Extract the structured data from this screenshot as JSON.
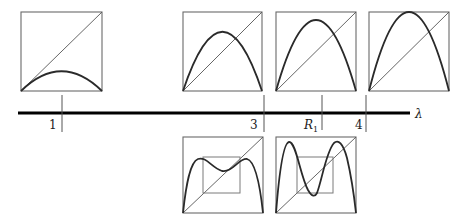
{
  "figure": {
    "axis": {
      "symbol": "λ",
      "ticks": [
        {
          "label": "1",
          "x": 62
        },
        {
          "label": "3",
          "x": 264
        },
        {
          "label": "R",
          "subscript": "1",
          "x": 322
        },
        {
          "label": "4",
          "x": 366
        }
      ]
    },
    "top_panels": [
      {
        "name": "lambda-1",
        "lambda": 1.0,
        "peak_fraction": 0.25
      },
      {
        "name": "lambda-3",
        "lambda": 3.0,
        "peak_fraction": 0.75
      },
      {
        "name": "lambda-R1",
        "lambda": 3.57,
        "peak_fraction": 0.9
      },
      {
        "name": "lambda-4",
        "lambda": 4.0,
        "peak_fraction": 1.0
      }
    ],
    "bottom_panels": [
      {
        "name": "second-iterate-lambda-3",
        "lambda": 3.0,
        "function": "f(f(x))"
      },
      {
        "name": "second-iterate-lambda-R1",
        "lambda": 3.57,
        "function": "f(f(x))"
      }
    ]
  }
}
